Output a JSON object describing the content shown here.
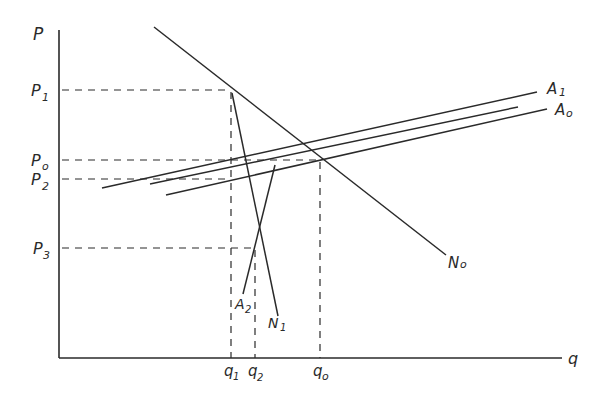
{
  "diagram": {
    "type": "economics supply-demand diagram",
    "axes": {
      "y_label": "P",
      "x_label": "q"
    },
    "price_labels": [
      {
        "main": "P",
        "sub": "1",
        "y": 90
      },
      {
        "main": "P",
        "sub": "o",
        "y": 160
      },
      {
        "main": "P",
        "sub": "2",
        "y": 179
      },
      {
        "main": "P",
        "sub": "3",
        "y": 248
      }
    ],
    "quantity_labels": [
      {
        "main": "q",
        "sub": "1",
        "x": 231
      },
      {
        "main": "q",
        "sub": "2",
        "x": 255
      },
      {
        "main": "q",
        "sub": "o",
        "x": 320
      }
    ],
    "curves": [
      {
        "name": "N",
        "sub": "o",
        "description": "demand curve N0 (downward sloping)"
      },
      {
        "name": "A",
        "sub": "1",
        "description": "supply curve A1 (upper, upward sloping)"
      },
      {
        "name": "A",
        "sub": "o",
        "description": "supply curve A0 (lower, upward sloping)"
      },
      {
        "name": "A",
        "sub": "2",
        "description": "steep supply curve A2"
      },
      {
        "name": "N",
        "sub": "1",
        "description": "steep demand curve N1"
      }
    ]
  }
}
